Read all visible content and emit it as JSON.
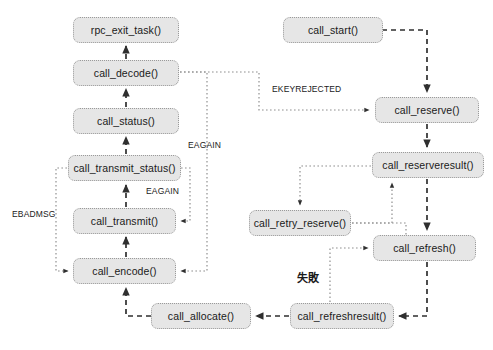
{
  "diagram": {
    "canvas": {
      "width": 493,
      "height": 350,
      "background": "#ffffff"
    },
    "style": {
      "node_fill": "#e6e6e6",
      "node_border": "#9a9a9a",
      "edge_dashed": "#3a3a3a",
      "edge_dotted": "#8a8a8a",
      "text": "#1a1a1a"
    },
    "nodes": [
      {
        "id": "rpc_exit_task",
        "label": "rpc_exit_task()",
        "x": 73,
        "y": 17,
        "w": 106,
        "h": 26
      },
      {
        "id": "call_decode",
        "label": "call_decode()",
        "x": 73,
        "y": 60,
        "w": 106,
        "h": 26
      },
      {
        "id": "call_status",
        "label": "call_status()",
        "x": 73,
        "y": 108,
        "w": 106,
        "h": 26
      },
      {
        "id": "call_transmit_status",
        "label": "call_transmit_status()",
        "x": 68,
        "y": 155,
        "w": 113,
        "h": 26
      },
      {
        "id": "call_transmit",
        "label": "call_transmit()",
        "x": 73,
        "y": 208,
        "w": 103,
        "h": 26
      },
      {
        "id": "call_encode",
        "label": "call_encode()",
        "x": 73,
        "y": 258,
        "w": 103,
        "h": 26
      },
      {
        "id": "call_allocate",
        "label": "call_allocate()",
        "x": 151,
        "y": 303,
        "w": 100,
        "h": 26
      },
      {
        "id": "call_start",
        "label": "call_start()",
        "x": 283,
        "y": 17,
        "w": 100,
        "h": 26
      },
      {
        "id": "call_reserve",
        "label": "call_reserve()",
        "x": 375,
        "y": 97,
        "w": 104,
        "h": 26
      },
      {
        "id": "call_reserveresult",
        "label": "call_reserveresult()",
        "x": 372,
        "y": 152,
        "w": 112,
        "h": 26
      },
      {
        "id": "call_retry_reserve",
        "label": "call_retry_reserve()",
        "x": 249,
        "y": 210,
        "w": 102,
        "h": 26
      },
      {
        "id": "call_refresh",
        "label": "call_refresh()",
        "x": 373,
        "y": 235,
        "w": 103,
        "h": 26
      },
      {
        "id": "call_refreshresult",
        "label": "call_refreshresult()",
        "x": 290,
        "y": 303,
        "w": 104,
        "h": 26
      }
    ],
    "edge_labels": [
      {
        "id": "eagain-decode",
        "text": "EAGAIN",
        "x": 188,
        "y": 140,
        "cjk": false
      },
      {
        "id": "eagain-transmit",
        "text": "EAGAIN",
        "x": 148,
        "y": 186,
        "cjk": false
      },
      {
        "id": "ebadmsg",
        "text": "EBADMSG",
        "x": 12,
        "y": 209,
        "cjk": false
      },
      {
        "id": "ekeyrejected",
        "text": "EKEYREJECTED",
        "x": 272,
        "y": 84,
        "cjk": false
      },
      {
        "id": "shibai",
        "text": "失敗",
        "x": 299,
        "y": 272,
        "cjk": true
      }
    ],
    "edges": [
      {
        "from": "call_decode",
        "to": "rpc_exit_task",
        "kind": "dashed"
      },
      {
        "from": "call_status",
        "to": "call_decode",
        "kind": "dashed"
      },
      {
        "from": "call_transmit_status",
        "to": "call_status",
        "kind": "dashed"
      },
      {
        "from": "call_transmit",
        "to": "call_transmit_status",
        "kind": "dashed"
      },
      {
        "from": "call_encode",
        "to": "call_transmit",
        "kind": "dashed"
      },
      {
        "from": "call_allocate",
        "to": "call_encode",
        "kind": "dashed"
      },
      {
        "from": "call_refreshresult",
        "to": "call_allocate",
        "kind": "dashed"
      },
      {
        "from": "call_start",
        "to": "call_reserve",
        "kind": "dashed"
      },
      {
        "from": "call_reserve",
        "to": "call_reserveresult",
        "kind": "dashed"
      },
      {
        "from": "call_reserveresult",
        "to": "call_refresh",
        "kind": "dashed"
      },
      {
        "from": "call_refresh",
        "to": "call_refreshresult",
        "kind": "dashed"
      },
      {
        "from": "call_decode",
        "to": "call_reserve",
        "kind": "dotted",
        "label": "EKEYREJECTED"
      },
      {
        "from": "call_decode",
        "to": "call_encode",
        "kind": "dotted",
        "label": "EAGAIN"
      },
      {
        "from": "call_transmit_status",
        "to": "call_transmit",
        "kind": "dotted",
        "label": "EAGAIN"
      },
      {
        "from": "call_transmit_status",
        "to": "call_encode",
        "kind": "dotted",
        "label": "EBADMSG"
      },
      {
        "from": "call_reserveresult",
        "to": "call_retry_reserve",
        "kind": "dotted"
      },
      {
        "from": "call_retry_reserve",
        "to": "call_reserveresult",
        "kind": "dotted"
      },
      {
        "from": "call_retry_reserve",
        "to": "call_refresh",
        "kind": "dotted"
      },
      {
        "from": "call_refreshresult",
        "to": "call_refresh",
        "kind": "dotted",
        "label": "失敗"
      }
    ]
  }
}
